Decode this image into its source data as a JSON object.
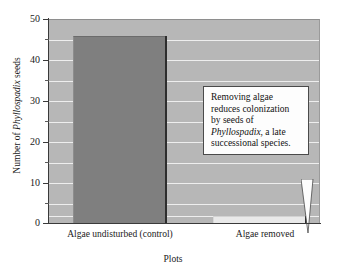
{
  "chart_data": {
    "type": "bar",
    "title": "",
    "subtitle": "",
    "xlabel": "Plots",
    "ylabel": "Number of Phyllospadix seeds",
    "ylabel_italic_part": "Phyllospadix",
    "categories": [
      "Algae undisturbed (control)",
      "Algae removed"
    ],
    "values": [
      46,
      2
    ],
    "series": [
      {
        "name": "Number of Phyllospadix seeds",
        "values": [
          46,
          2
        ]
      }
    ],
    "ylim": [
      0,
      50
    ],
    "y_major_ticks": [
      0,
      10,
      20,
      30,
      40,
      50
    ],
    "y_minor_ticks": [
      5,
      15,
      25,
      35,
      45
    ],
    "y_tick_labels": [
      "0",
      "10",
      "20",
      "30",
      "40",
      "50"
    ],
    "grid": true,
    "grid_orientation": "horizontal",
    "grid_interval": 5,
    "legend": false,
    "legend_position": "none",
    "plot_background_color": "#b7b7b7",
    "gridline_color": "#eeeeee",
    "bar_colors": [
      "#7f7f7f",
      "#e9e9e9"
    ],
    "bar_shadow_color": "#2e2e2e",
    "figure_background_color": "#ffffff",
    "axis_color": "#3a3a3a",
    "annotations": [
      {
        "text_lines": [
          "Removing algae",
          "reduces colonization",
          "by seeds of",
          "Phyllospadix, a late",
          "successional species.",
          ""
        ],
        "text_full": "Removing algae reduces colonization by seeds of Phyllospadix, a late successional species.",
        "italic_word": "Phyllospadix",
        "points_to_category": "Algae removed",
        "box_fill": "#fdfdfd",
        "box_border": "#4a4a4a"
      }
    ]
  },
  "axis": {
    "y_title_prefix": "Number of ",
    "y_title_italic": "Phyllospadix",
    "y_title_suffix": " seeds",
    "x_title": "Plots"
  },
  "callout": {
    "line1": "Removing algae",
    "line2": "reduces colonization",
    "line3": "by seeds of",
    "line4_italic": "Phyllospadix",
    "line4_rest": ", a late",
    "line5": "successional species."
  }
}
